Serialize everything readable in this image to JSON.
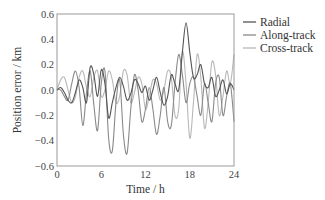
{
  "chart_data": {
    "type": "line",
    "title": "",
    "xlabel": "Time / h",
    "ylabel": "Position error / km",
    "xlim": [
      0,
      24
    ],
    "ylim": [
      -0.6,
      0.6
    ],
    "xticks": [
      0,
      6,
      12,
      18,
      24
    ],
    "yticks": [
      0.6,
      0.4,
      0.2,
      0.0,
      -0.2,
      -0.4,
      -0.6
    ],
    "ytick_labels": [
      "0.6",
      "0.4",
      "0.2",
      "0.0",
      "−0.2",
      "−0.4",
      "−0.6"
    ],
    "grid": false,
    "legend_position": "upper right, outside plot",
    "series": [
      {
        "name": "Radial",
        "color": "#555555",
        "x": [
          0,
          0.5,
          1.0,
          1.5,
          2.0,
          2.5,
          3.0,
          3.5,
          4.0,
          4.5,
          5.0,
          5.5,
          6.0,
          6.5,
          7.0,
          7.5,
          8.0,
          8.5,
          9.0,
          9.5,
          10.0,
          10.5,
          11.0,
          11.5,
          12.0,
          12.5,
          13.0,
          13.5,
          14.0,
          14.5,
          15.0,
          15.5,
          16.0,
          16.5,
          17.0,
          17.5,
          18.0,
          18.5,
          19.0,
          19.5,
          20.0,
          20.5,
          21.0,
          21.5,
          22.0,
          22.5,
          23.0,
          23.5,
          24.0
        ],
        "values": [
          0.0,
          0.02,
          -0.02,
          -0.08,
          -0.1,
          -0.02,
          0.08,
          0.02,
          -0.1,
          0.18,
          0.12,
          -0.05,
          0.16,
          0.05,
          -0.22,
          -0.1,
          0.02,
          0.1,
          0.03,
          -0.08,
          -0.03,
          0.08,
          0.05,
          -0.02,
          0.03,
          -0.08,
          0.0,
          0.1,
          -0.02,
          -0.12,
          -0.05,
          0.12,
          0.05,
          0.0,
          0.3,
          0.53,
          0.3,
          0.1,
          0.12,
          0.2,
          0.05,
          0.02,
          0.1,
          -0.05,
          0.0,
          0.08,
          -0.03,
          0.05,
          0.0
        ]
      },
      {
        "name": "Along-track",
        "color": "#8a8a8a",
        "x": [
          0,
          0.5,
          1.0,
          1.5,
          2.0,
          2.5,
          3.0,
          3.5,
          4.0,
          4.5,
          5.0,
          5.5,
          6.0,
          6.5,
          7.0,
          7.5,
          8.0,
          8.5,
          9.0,
          9.5,
          10.0,
          10.5,
          11.0,
          11.5,
          12.0,
          12.5,
          13.0,
          13.5,
          14.0,
          14.5,
          15.0,
          15.5,
          16.0,
          16.5,
          17.0,
          17.5,
          18.0,
          18.5,
          19.0,
          19.5,
          20.0,
          20.5,
          21.0,
          21.5,
          22.0,
          22.5,
          23.0,
          23.5,
          24.0
        ],
        "values": [
          0.0,
          0.0,
          -0.05,
          -0.08,
          0.05,
          0.15,
          0.02,
          -0.28,
          -0.02,
          0.15,
          -0.12,
          -0.32,
          0.05,
          0.15,
          -0.38,
          -0.48,
          -0.1,
          0.08,
          -0.35,
          -0.5,
          -0.15,
          0.12,
          0.0,
          -0.25,
          -0.15,
          0.02,
          -0.15,
          -0.35,
          -0.2,
          0.02,
          -0.25,
          -0.28,
          0.05,
          0.28,
          0.12,
          -0.1,
          0.05,
          0.1,
          -0.05,
          -0.2,
          0.05,
          -0.1,
          -0.25,
          0.05,
          0.1,
          -0.2,
          -0.05,
          0.05,
          -0.25
        ]
      },
      {
        "name": "Cross-track",
        "color": "#b8b8b8",
        "x": [
          0,
          0.5,
          1.0,
          1.5,
          2.0,
          2.5,
          3.0,
          3.5,
          4.0,
          4.5,
          5.0,
          5.5,
          6.0,
          6.5,
          7.0,
          7.5,
          8.0,
          8.5,
          9.0,
          9.5,
          10.0,
          10.5,
          11.0,
          11.5,
          12.0,
          12.5,
          13.0,
          13.5,
          14.0,
          14.5,
          15.0,
          15.5,
          16.0,
          16.5,
          17.0,
          17.5,
          18.0,
          18.5,
          19.0,
          19.5,
          20.0,
          20.5,
          21.0,
          21.5,
          22.0,
          22.5,
          23.0,
          23.5,
          24.0
        ],
        "values": [
          0.0,
          0.08,
          0.1,
          0.0,
          -0.1,
          -0.05,
          0.1,
          0.15,
          0.02,
          -0.05,
          0.1,
          0.15,
          -0.05,
          0.0,
          0.15,
          0.08,
          -0.1,
          -0.05,
          0.15,
          0.12,
          -0.1,
          -0.02,
          0.1,
          0.05,
          -0.15,
          -0.05,
          0.08,
          0.05,
          -0.08,
          0.0,
          0.15,
          0.1,
          -0.2,
          -0.15,
          0.3,
          0.05,
          -0.38,
          -0.1,
          0.28,
          0.1,
          -0.3,
          -0.1,
          0.22,
          0.12,
          -0.2,
          -0.05,
          0.15,
          0.05,
          0.28
        ]
      }
    ]
  },
  "legend": {
    "items": [
      {
        "label": "Radial",
        "color": "#555555"
      },
      {
        "label": "Along-track",
        "color": "#8a8a8a"
      },
      {
        "label": "Cross-track",
        "color": "#b8b8b8"
      }
    ]
  }
}
